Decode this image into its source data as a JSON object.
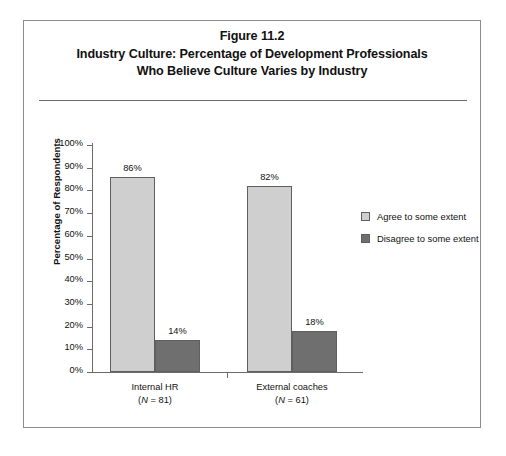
{
  "figure": {
    "title_lines": [
      "Figure 11.2",
      "Industry Culture: Percentage of Development Professionals",
      "Who Believe Culture Varies by Industry"
    ]
  },
  "colors": {
    "agree": "#cfcfcf",
    "disagree": "#6f6f6f",
    "bar_border": "#5f5f5f",
    "axis": "#6b6b6b",
    "frame": "#8c8c8c",
    "text": "#111111"
  },
  "legend": {
    "position": "right",
    "items": [
      {
        "label": "Agree to some extent",
        "color": "#cfcfcf"
      },
      {
        "label": "Disagree to some extent",
        "color": "#6f6f6f"
      }
    ]
  },
  "chart_data": {
    "type": "bar",
    "title": "Industry Culture: Percentage of Development Professionals Who Believe Culture Varies by Industry",
    "subtitle": "Figure 11.2",
    "xlabel": "",
    "ylabel": "Percentage of Respondents",
    "ylim": [
      0,
      100
    ],
    "ytick_labels": [
      "0%",
      "10%",
      "20%",
      "30%",
      "40%",
      "50%",
      "60%",
      "70%",
      "80%",
      "90%",
      "100%"
    ],
    "ytick_values": [
      0,
      10,
      20,
      30,
      40,
      50,
      60,
      70,
      80,
      90,
      100
    ],
    "grid": false,
    "categories": [
      "Internal HR",
      "External coaches"
    ],
    "category_sublabels": [
      "(N = 81)",
      "(N = 61)"
    ],
    "category_n": [
      81,
      61
    ],
    "series": [
      {
        "name": "Agree to some extent",
        "values": [
          86,
          82
        ],
        "value_labels": [
          "86%",
          "82%"
        ]
      },
      {
        "name": "Disagree to some extent",
        "values": [
          14,
          18
        ],
        "value_labels": [
          "14%",
          "18%"
        ]
      }
    ]
  }
}
